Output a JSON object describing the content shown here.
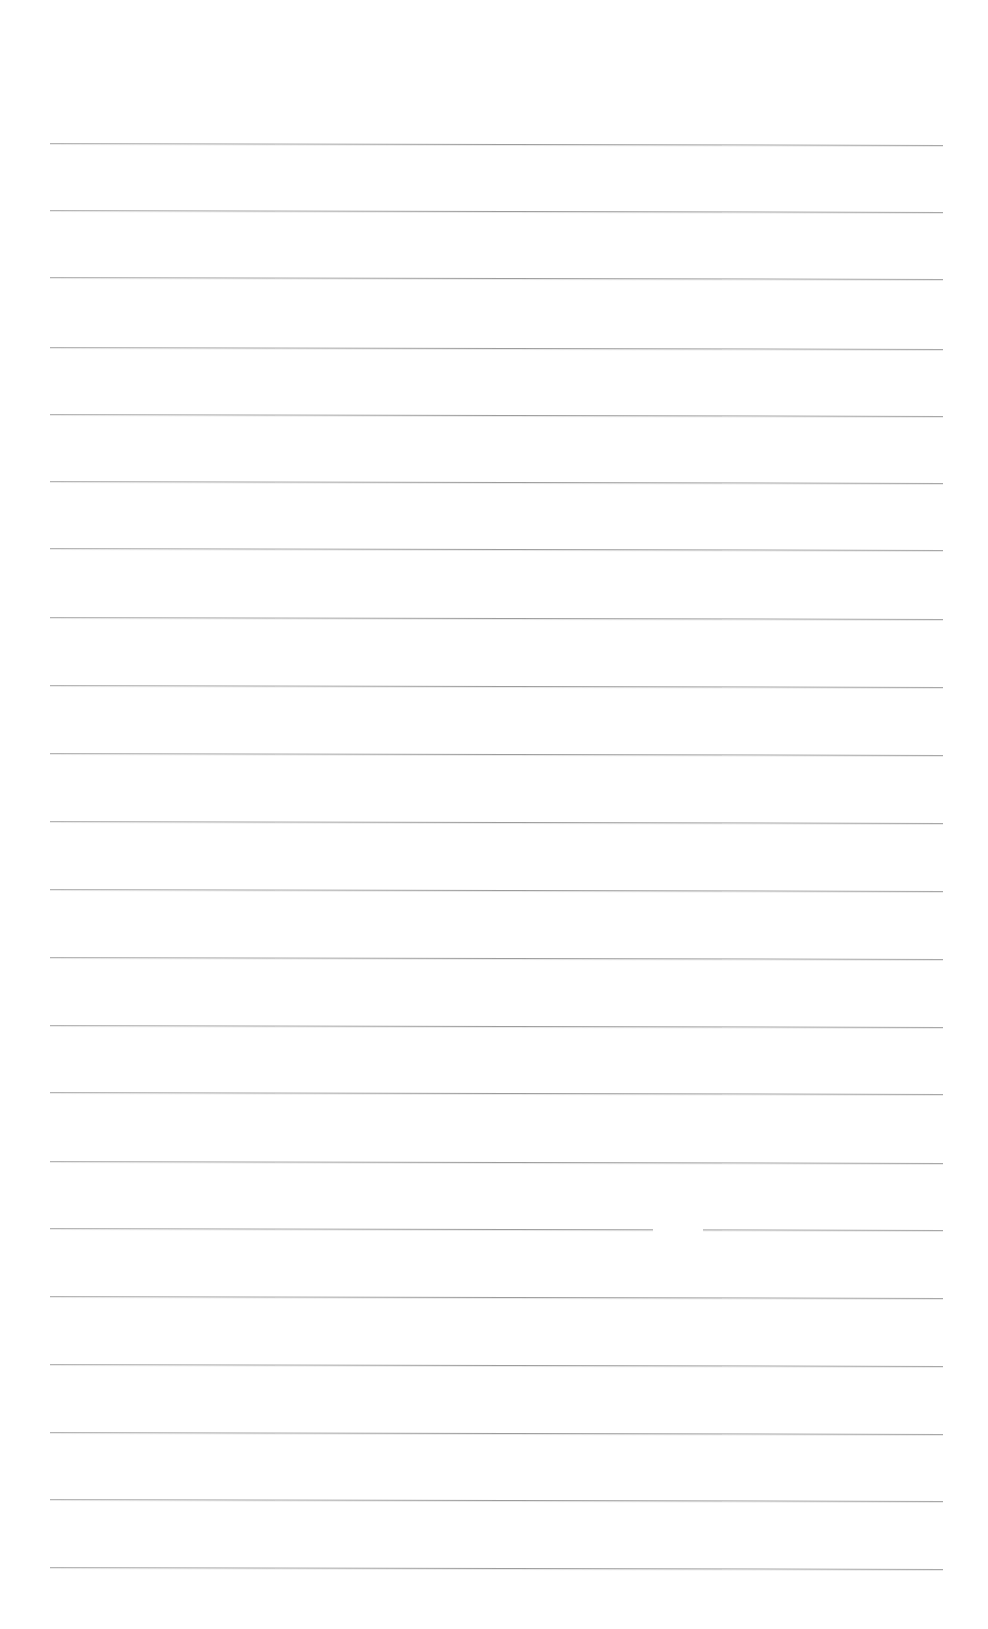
{
  "page": {
    "type": "blank lined paper",
    "background_color": "#ffffff",
    "line_color": "#a0a0a0",
    "line_count": 22,
    "line_left_x": 50,
    "line_right_x": 943,
    "line_slope_px": 2,
    "lines_y": [
      143,
      210,
      277,
      347,
      414,
      481,
      548,
      617,
      685,
      753,
      821,
      889,
      957,
      1025,
      1092,
      1161,
      1228,
      1296,
      1364,
      1432,
      1499,
      1567
    ],
    "line_gaps": [
      {
        "line_index": 16,
        "x_start": 653,
        "x_end": 703
      }
    ]
  }
}
